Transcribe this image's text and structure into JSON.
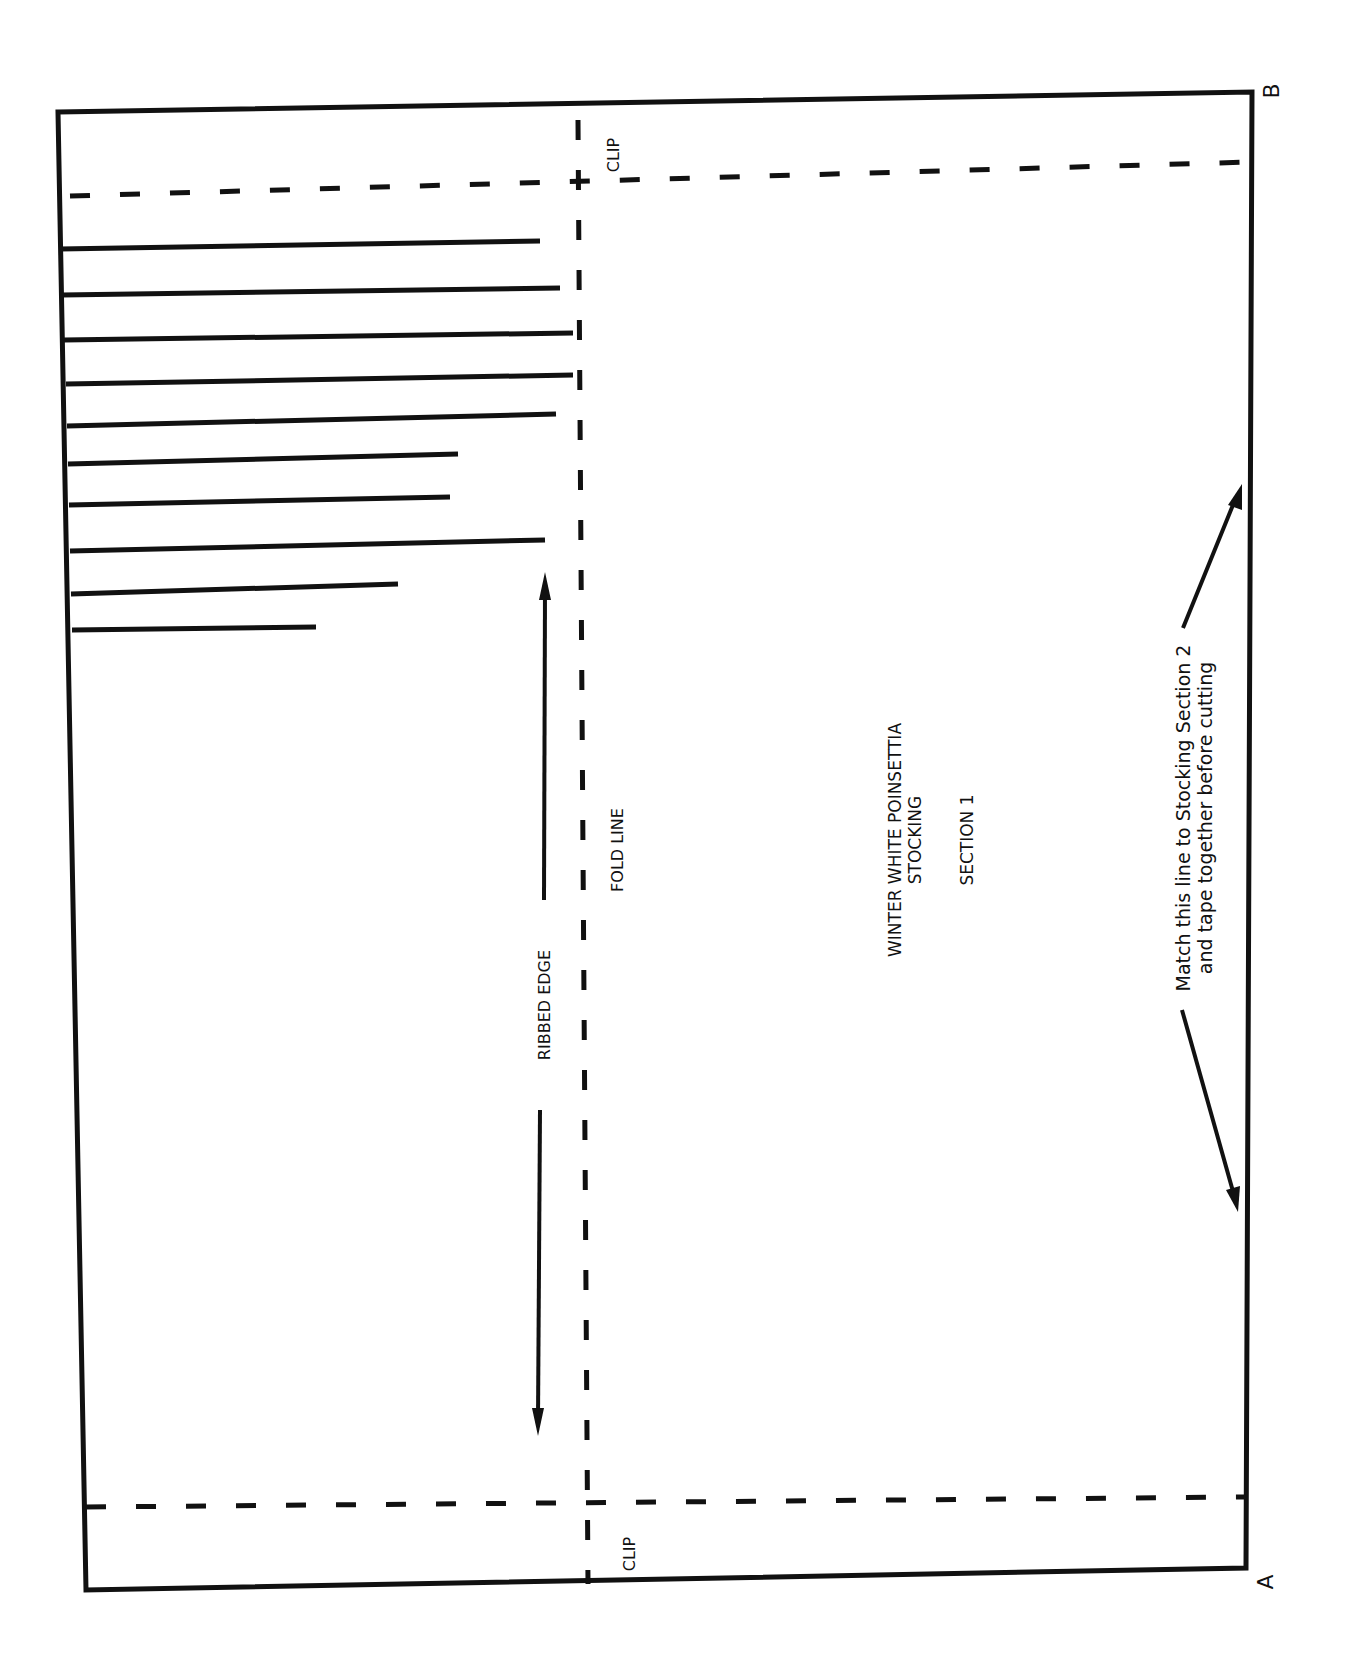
{
  "pattern": {
    "title_line1": "WINTER WHITE POINSETTIA",
    "title_line2": "STOCKING",
    "section": "SECTION 1",
    "fold_label": "FOLD LINE",
    "ribbed_label": "RIBBED EDGE",
    "clip_top": "CLIP",
    "clip_bottom": "CLIP",
    "corner_a": "A",
    "corner_b": "B",
    "match_note_line1": "Match this line to Stocking Section 2",
    "match_note_line2": "and tape together before cutting"
  },
  "colors": {
    "ink": "#111111",
    "paper": "#ffffff"
  },
  "ribs": [
    {
      "y_left": 249,
      "x_end": 540,
      "y_end": 241
    },
    {
      "y_left": 295,
      "x_end": 560,
      "y_end": 288
    },
    {
      "y_left": 340,
      "x_end": 573,
      "y_end": 333
    },
    {
      "y_left": 384,
      "x_end": 573,
      "y_end": 375
    },
    {
      "y_left": 426,
      "x_end": 556,
      "y_end": 414
    },
    {
      "y_left": 464,
      "x_end": 458,
      "y_end": 454
    },
    {
      "y_left": 505,
      "x_end": 450,
      "y_end": 497
    },
    {
      "y_left": 551,
      "x_end": 545,
      "y_end": 540
    },
    {
      "y_left": 594,
      "x_end": 398,
      "y_end": 584
    },
    {
      "y_left": 630,
      "x_end": 316,
      "y_end": 627
    }
  ]
}
